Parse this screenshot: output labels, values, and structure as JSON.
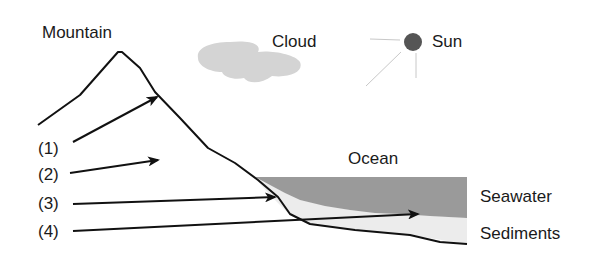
{
  "labels": {
    "mountain": "Mountain",
    "cloud": "Cloud",
    "sun": "Sun",
    "ocean": "Ocean",
    "seawater": "Seawater",
    "sediments": "Sediments"
  },
  "pathways": [
    {
      "label": "(1)"
    },
    {
      "label": "(2)"
    },
    {
      "label": "(3)"
    },
    {
      "label": "(4)"
    }
  ],
  "colors": {
    "outline": "#111111",
    "seawater": "#9a9a9a",
    "sediments": "#ececec",
    "cloud": "#d4d4d4",
    "sun": "#555555",
    "sun_rays": "#c8c8c8"
  }
}
